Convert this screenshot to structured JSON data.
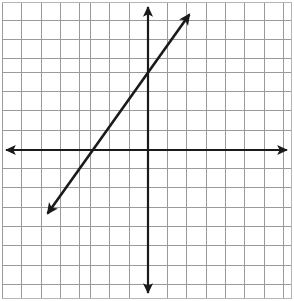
{
  "figure": {
    "width": 294,
    "height": 301,
    "background_color": "#ffffff"
  },
  "grid": {
    "cell_size_px": 19.3,
    "line_color": "#9a9a9a",
    "border_color": "#b4b4b4",
    "columns": 15,
    "rows": 15,
    "left_px": 2,
    "top_px": 2,
    "right_px": 291,
    "bottom_px": 299,
    "visible": true
  },
  "axes": {
    "color": "#1a1a1a",
    "stroke_width": 2.2,
    "arrowheads": "both-ends",
    "x_axis": {
      "label": "x-axis",
      "pixel_y": 150,
      "start_px": 3,
      "end_px": 290,
      "range": [
        -7.5,
        7.4
      ],
      "tick_labels": []
    },
    "y_axis": {
      "label": "y-axis",
      "pixel_x": 148,
      "start_px": 3,
      "end_px": 296,
      "range": [
        -7.6,
        7.7
      ],
      "tick_labels": []
    },
    "origin_px": [
      148,
      150
    ]
  },
  "chart_data": {
    "type": "line",
    "xlabel": "x",
    "ylabel": "y",
    "grid": true,
    "legend_position": "none",
    "xlim": [
      -7.5,
      7.4
    ],
    "ylim": [
      -7.6,
      7.7
    ],
    "x_tick_labels": [],
    "y_tick_labels": [],
    "series": [
      {
        "name": "graphed line",
        "color": "#1a1a1a",
        "slope": 1.3333,
        "y_intercept": 4,
        "x_intercept": -3,
        "equation": "y = (4/3)x + 4",
        "arrowheads": "both-ends",
        "points": [
          {
            "x": -3,
            "y": 0
          },
          {
            "x": 0,
            "y": 4
          }
        ],
        "endpoints_px": [
          {
            "x": 43,
            "y": 220
          },
          {
            "x": 194,
            "y": 8
          }
        ],
        "endpoints_units": [
          {
            "x": -5.44,
            "y": -3.63
          },
          {
            "x": 2.38,
            "y": 7.36
          }
        ]
      }
    ]
  }
}
